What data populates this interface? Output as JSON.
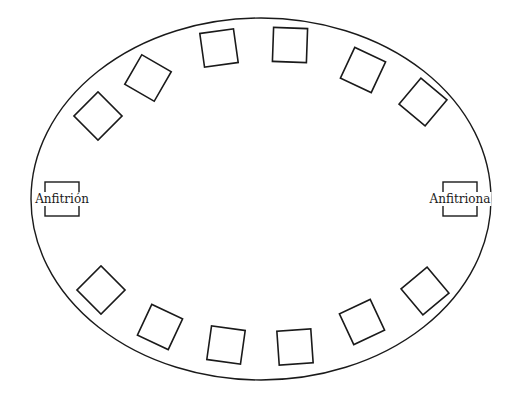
{
  "diagram": {
    "type": "table-seating-plan",
    "table_shape": "oval",
    "colors": {
      "stroke": "#1a1a1a",
      "background": "#ffffff"
    },
    "table": {
      "cx": 261,
      "cy": 199,
      "rx": 230,
      "ry": 181
    },
    "hosts": [
      {
        "id": "host-left",
        "label": "Anfitrión",
        "x": 62,
        "y": 199
      },
      {
        "id": "host-right",
        "label": "Anfitriona",
        "x": 460,
        "y": 199
      }
    ],
    "seat_size": 34,
    "seats": [
      {
        "x": 98,
        "y": 116,
        "rot": 45
      },
      {
        "x": 148,
        "y": 78,
        "rot": 30
      },
      {
        "x": 219,
        "y": 48,
        "rot": -8
      },
      {
        "x": 290,
        "y": 45,
        "rot": 2
      },
      {
        "x": 363,
        "y": 70,
        "rot": 25
      },
      {
        "x": 423,
        "y": 102,
        "rot": 40
      },
      {
        "x": 101,
        "y": 290,
        "rot": -45
      },
      {
        "x": 160,
        "y": 327,
        "rot": 25
      },
      {
        "x": 226,
        "y": 345,
        "rot": 8
      },
      {
        "x": 295,
        "y": 347,
        "rot": -4
      },
      {
        "x": 362,
        "y": 322,
        "rot": -25
      },
      {
        "x": 425,
        "y": 291,
        "rot": -40
      }
    ],
    "seat_count": 12
  }
}
